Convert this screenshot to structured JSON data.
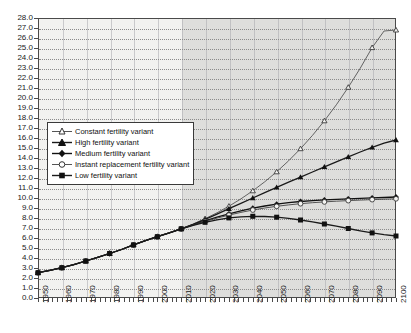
{
  "chart_data": {
    "type": "line",
    "title": "",
    "xlabel": "",
    "ylabel": "",
    "xlim": [
      1950,
      2100
    ],
    "ylim": [
      0.0,
      28.0
    ],
    "grid": true,
    "legend_position": "inside-left",
    "y_ticks": [
      "0.0",
      "1.0",
      "2.0",
      "3.0",
      "4.0",
      "5.0",
      "6.0",
      "7.0",
      "8.0",
      "9.0",
      "10.0",
      "11.0",
      "12.0",
      "13.0",
      "14.0",
      "15.0",
      "16.0",
      "17.0",
      "18.0",
      "19.0",
      "20.0",
      "21.0",
      "22.0",
      "23.0",
      "24.0",
      "25.0",
      "26.0",
      "27.0",
      "28.0"
    ],
    "x_ticks": [
      "1950",
      "1960",
      "1970",
      "1980",
      "1990",
      "2000",
      "2010",
      "2020",
      "2030",
      "2040",
      "2050",
      "2060",
      "2070",
      "2080",
      "2090",
      "2100"
    ],
    "x_minor_step": 2,
    "projection_start": 2010,
    "x": [
      1950,
      1955,
      1960,
      1965,
      1970,
      1975,
      1980,
      1985,
      1990,
      1995,
      2000,
      2005,
      2010,
      2015,
      2020,
      2025,
      2030,
      2035,
      2040,
      2045,
      2050,
      2055,
      2060,
      2065,
      2070,
      2075,
      2080,
      2085,
      2090,
      2095,
      2100
    ],
    "series": [
      {
        "name": "Constant fertility variant",
        "marker": "open-triangle",
        "color": "#555555",
        "values": [
          2.53,
          2.77,
          3.03,
          3.33,
          3.7,
          4.07,
          4.45,
          4.85,
          5.31,
          5.74,
          6.13,
          6.51,
          6.92,
          7.4,
          7.93,
          8.52,
          9.18,
          9.91,
          10.72,
          11.62,
          12.62,
          13.72,
          14.93,
          16.26,
          17.72,
          19.32,
          21.07,
          22.97,
          25.04,
          26.7,
          26.8
        ]
      },
      {
        "name": "High fertility variant",
        "marker": "filled-triangle",
        "color": "#1a1a1a",
        "values": [
          2.53,
          2.77,
          3.03,
          3.33,
          3.7,
          4.07,
          4.45,
          4.85,
          5.31,
          5.74,
          6.13,
          6.51,
          6.92,
          7.36,
          7.86,
          8.39,
          8.93,
          9.47,
          10.0,
          10.54,
          11.06,
          11.58,
          12.09,
          12.6,
          13.11,
          13.62,
          14.12,
          14.6,
          15.06,
          15.48,
          15.8
        ]
      },
      {
        "name": "Medium fertility variant",
        "marker": "filled-diamond",
        "color": "#111111",
        "values": [
          2.53,
          2.77,
          3.03,
          3.33,
          3.7,
          4.07,
          4.45,
          4.85,
          5.31,
          5.74,
          6.13,
          6.51,
          6.92,
          7.32,
          7.72,
          8.08,
          8.42,
          8.72,
          8.98,
          9.2,
          9.38,
          9.53,
          9.65,
          9.74,
          9.81,
          9.87,
          9.92,
          9.97,
          10.01,
          10.05,
          10.1
        ]
      },
      {
        "name": "Instant replacement fertility variant",
        "marker": "open-circle",
        "color": "#444444",
        "values": [
          2.53,
          2.77,
          3.03,
          3.33,
          3.7,
          4.07,
          4.45,
          4.85,
          5.31,
          5.74,
          6.13,
          6.51,
          6.92,
          7.3,
          7.66,
          7.99,
          8.29,
          8.56,
          8.8,
          9.0,
          9.17,
          9.31,
          9.43,
          9.53,
          9.61,
          9.68,
          9.74,
          9.79,
          9.84,
          9.88,
          9.92
        ]
      },
      {
        "name": "Low fertility variant",
        "marker": "filled-square",
        "color": "#1a1a1a",
        "values": [
          2.53,
          2.77,
          3.03,
          3.33,
          3.7,
          4.07,
          4.45,
          4.85,
          5.31,
          5.74,
          6.13,
          6.51,
          6.92,
          7.26,
          7.57,
          7.82,
          8.01,
          8.12,
          8.17,
          8.15,
          8.08,
          7.96,
          7.8,
          7.61,
          7.4,
          7.18,
          6.95,
          6.72,
          6.51,
          6.33,
          6.2
        ]
      }
    ]
  }
}
